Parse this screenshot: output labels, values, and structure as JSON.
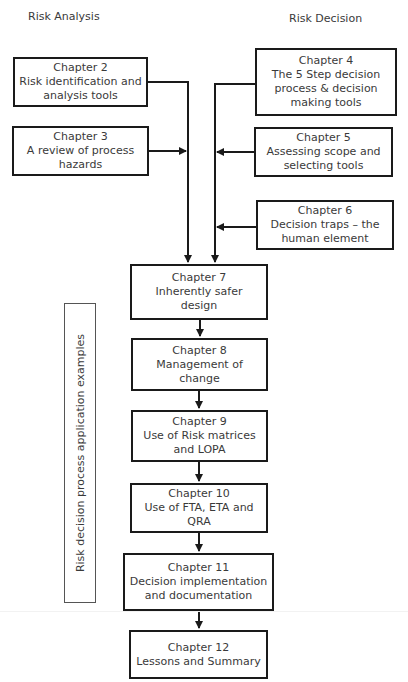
{
  "headers": {
    "left": "Risk Analysis",
    "right": "Risk Decision"
  },
  "side_label": "Risk decision process application examples",
  "chapters": [
    {
      "id": 2,
      "lines": [
        "Chapter 2",
        "Risk identification and",
        "analysis tools"
      ]
    },
    {
      "id": 3,
      "lines": [
        "Chapter 3",
        "A review of process",
        "hazards"
      ]
    },
    {
      "id": 4,
      "lines": [
        "Chapter 4",
        "The 5 Step decision",
        "process & decision",
        "making tools"
      ]
    },
    {
      "id": 5,
      "lines": [
        "Chapter 5",
        "Assessing scope and",
        "selecting tools"
      ]
    },
    {
      "id": 6,
      "lines": [
        "Chapter 6",
        "Decision traps – the",
        "human element"
      ]
    },
    {
      "id": 7,
      "lines": [
        "Chapter 7",
        "Inherently safer",
        "design"
      ]
    },
    {
      "id": 8,
      "lines": [
        "Chapter 8",
        "Management of",
        "change"
      ]
    },
    {
      "id": 9,
      "lines": [
        "Chapter 9",
        "Use of Risk matrices",
        "and LOPA"
      ]
    },
    {
      "id": 10,
      "lines": [
        "Chapter 10",
        "Use of FTA, ETA and",
        "QRA"
      ]
    },
    {
      "id": 11,
      "lines": [
        "Chapter 11",
        "Decision implementation",
        "and documentation"
      ]
    },
    {
      "id": 12,
      "lines": [
        "Chapter 12",
        "Lessons and Summary"
      ]
    }
  ],
  "colors": {
    "line": "#1a1a1a",
    "text": "#3a3a3a",
    "side_border": "#555555"
  }
}
